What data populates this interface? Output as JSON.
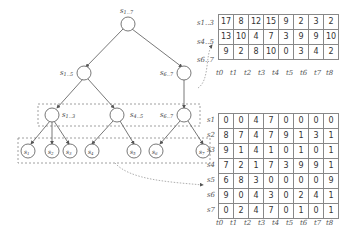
{
  "tree": {
    "root": {
      "label": "s1..7"
    },
    "level1": [
      {
        "label": "s1..5"
      },
      {
        "label": "s6..7"
      }
    ],
    "level2": [
      {
        "label": "s1..3"
      },
      {
        "label": "s4..5"
      },
      {
        "label": "s6..7"
      }
    ],
    "leaves": [
      {
        "label": "s1"
      },
      {
        "label": "s2"
      },
      {
        "label": "s3"
      },
      {
        "label": "s4"
      },
      {
        "label": "s5"
      },
      {
        "label": "s6"
      },
      {
        "label": "s7"
      }
    ]
  },
  "top_table": {
    "row_labels": [
      "s1..3",
      "s4..5",
      "s6..7"
    ],
    "col_labels": [
      "t0",
      "t1",
      "t2",
      "t3",
      "t4",
      "t5",
      "t6",
      "t7",
      "t8"
    ],
    "rows": [
      [
        17,
        8,
        12,
        15,
        9,
        2,
        3,
        2
      ],
      [
        13,
        10,
        4,
        7,
        3,
        9,
        9,
        10
      ],
      [
        9,
        2,
        8,
        10,
        0,
        3,
        4,
        2
      ]
    ]
  },
  "bottom_table": {
    "row_labels": [
      "s1",
      "s2",
      "s3",
      "s4",
      "s5",
      "s6",
      "s7"
    ],
    "col_labels": [
      "t0",
      "t1",
      "t2",
      "t3",
      "t4",
      "t5",
      "t6",
      "t7",
      "t8"
    ],
    "rows": [
      [
        0,
        0,
        4,
        7,
        0,
        0,
        0,
        0
      ],
      [
        8,
        7,
        4,
        7,
        9,
        1,
        3,
        1
      ],
      [
        9,
        1,
        4,
        1,
        0,
        1,
        0,
        1
      ],
      [
        7,
        2,
        1,
        7,
        3,
        9,
        9,
        1
      ],
      [
        6,
        8,
        3,
        0,
        0,
        0,
        0,
        9
      ],
      [
        9,
        0,
        4,
        3,
        0,
        2,
        4,
        1
      ],
      [
        0,
        2,
        4,
        7,
        0,
        1,
        0,
        1
      ]
    ]
  }
}
